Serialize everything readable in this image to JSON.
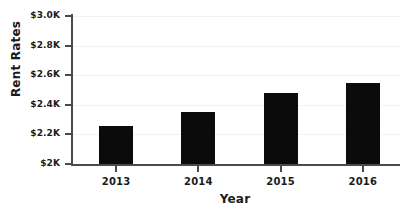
{
  "chart_data": {
    "type": "bar",
    "title": "",
    "xlabel": "Year",
    "ylabel": "Rent Rates",
    "categories": [
      "2013",
      "2014",
      "2015",
      "2016"
    ],
    "values": [
      2260,
      2350,
      2480,
      2550
    ],
    "value_labels": [
      "$2.26K",
      "$2.35K",
      "$2.48K",
      "$2.55K"
    ],
    "series": [
      {
        "name": "Rent Rates",
        "values": [
          2260,
          2350,
          2480,
          2550
        ]
      }
    ],
    "ylim": [
      2000,
      3000
    ],
    "yticks": [
      2000,
      2200,
      2400,
      2600,
      2800,
      3000
    ],
    "ytick_labels": [
      "$2K",
      "$2.2K",
      "$2.4K",
      "$2.6K",
      "$2.8K",
      "$3.0K"
    ],
    "grid": true,
    "legend": false,
    "bar_color": "#0b0b0b",
    "axis_color": "#4a4a4a",
    "grid_color": "#f2f2f2",
    "background_color": "#ffffff"
  }
}
